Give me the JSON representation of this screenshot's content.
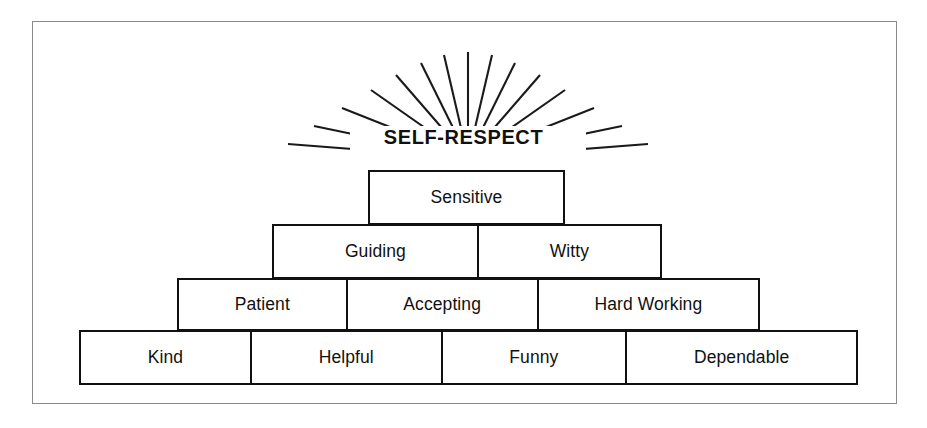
{
  "diagram": {
    "title": "SELF-RESPECT",
    "type": "self-esteem-pyramid",
    "frame_color": "#8a8a8a",
    "line_color": "#111111",
    "background_color": "#ffffff",
    "sunburst": {
      "name": "sunburst-rays",
      "ray_count": 17
    },
    "tiers": [
      {
        "level": 1,
        "cells": [
          {
            "label": "Sensitive"
          }
        ]
      },
      {
        "level": 2,
        "cells": [
          {
            "label": "Guiding"
          },
          {
            "label": "Witty"
          }
        ]
      },
      {
        "level": 3,
        "cells": [
          {
            "label": "Patient"
          },
          {
            "label": "Accepting"
          },
          {
            "label": "Hard Working"
          }
        ]
      },
      {
        "level": 4,
        "cells": [
          {
            "label": "Kind"
          },
          {
            "label": "Helpful"
          },
          {
            "label": "Funny"
          },
          {
            "label": "Dependable"
          }
        ]
      }
    ]
  }
}
